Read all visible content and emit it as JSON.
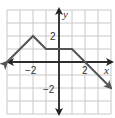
{
  "chart_data": {
    "type": "line",
    "title": "",
    "xlabel": "x",
    "ylabel": "y",
    "xlim": [
      -4,
      4
    ],
    "ylim": [
      -4,
      4
    ],
    "grid": true,
    "grid_step": 1,
    "x_tick_labels": [
      {
        "value": -2,
        "label": "−2"
      },
      {
        "value": 2,
        "label": "2"
      }
    ],
    "y_tick_labels": [
      {
        "value": 2,
        "label": "2"
      },
      {
        "value": -2,
        "label": "−2"
      }
    ],
    "series": [
      {
        "name": "piecewise",
        "points": [
          [
            -4,
            0
          ],
          [
            -2,
            2
          ],
          [
            -1,
            1
          ],
          [
            1,
            1
          ],
          [
            2,
            0
          ],
          [
            4,
            -2
          ]
        ],
        "arrow_start": true,
        "arrow_end": true,
        "color": "#555555"
      }
    ]
  },
  "labels": {
    "x_axis": "x",
    "y_axis": "y",
    "tick_x_neg2": "−2",
    "tick_x_2": "2",
    "tick_y_2": "2",
    "tick_y_neg2": "−2"
  },
  "colors": {
    "grid": "#c8c8c8",
    "axis": "#222222",
    "line": "#555555"
  }
}
